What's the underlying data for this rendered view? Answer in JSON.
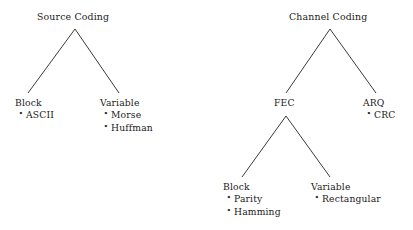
{
  "diagram": {
    "type": "tree-diagram",
    "background_color": "#ffffff",
    "text_color": "#1a1a1a",
    "edge_color": "#3a3a3a",
    "bullet_glyph": "•"
  },
  "trees": {
    "source_coding": {
      "root": "Source Coding",
      "block": {
        "label": "Block",
        "items": [
          "ASCII"
        ]
      },
      "variable": {
        "label": "Variable",
        "items": [
          "Morse",
          "Huffman"
        ]
      }
    },
    "channel_coding": {
      "root": "Channel Coding",
      "fec": {
        "label": "FEC",
        "block": {
          "label": "Block",
          "items": [
            "Parity",
            "Hamming"
          ]
        },
        "variable": {
          "label": "Variable",
          "items": [
            "Rectangular"
          ]
        }
      },
      "arq": {
        "label": "ARQ",
        "items": [
          "CRC"
        ]
      }
    }
  }
}
